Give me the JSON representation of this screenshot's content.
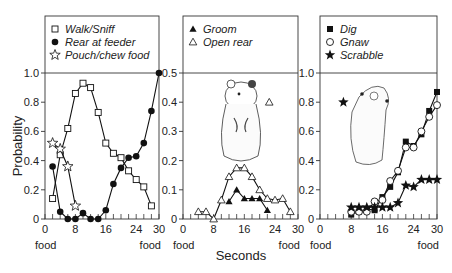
{
  "chart_data": {
    "type": "line",
    "xlabel": "Seconds",
    "ylabel": "Probability",
    "x_end_labels": [
      "food",
      "food"
    ],
    "panels": [
      {
        "id": "panel-locomotion",
        "xlim": [
          0,
          30
        ],
        "ylim": [
          0,
          1.0
        ],
        "x_ticks": [
          0,
          8,
          16,
          24,
          30
        ],
        "x_minor_step": 2,
        "y_ticks": [
          0,
          0.2,
          0.4,
          0.6,
          0.8,
          1.0
        ],
        "y_tick_labels": [
          "0",
          "0.2",
          "0.4",
          "0.6",
          "0.8",
          "1.0"
        ],
        "legend_position": "top",
        "series": [
          {
            "name": "Walk/Sniff",
            "marker": "open-square",
            "x": [
              2,
              4,
              6,
              8,
              10,
              12,
              14,
              16,
              18,
              20,
              22,
              24,
              26,
              28
            ],
            "y": [
              0.14,
              0.44,
              0.62,
              0.86,
              0.93,
              0.9,
              0.73,
              0.52,
              0.45,
              0.42,
              0.33,
              0.27,
              0.22,
              0.09
            ]
          },
          {
            "name": "Rear at feeder",
            "marker": "filled-circle",
            "x": [
              2,
              4,
              6,
              8,
              10,
              12,
              14,
              16,
              18,
              20,
              22,
              24,
              26,
              28,
              30
            ],
            "y": [
              0.36,
              0.05,
              0,
              0,
              0.04,
              0,
              0,
              0.06,
              0.24,
              0.35,
              0.42,
              0.43,
              0.52,
              0.74,
              1.0
            ]
          },
          {
            "name": "Pouch/chew food",
            "marker": "open-star",
            "x": [
              2,
              4,
              6,
              8
            ],
            "y": [
              0.52,
              0.48,
              0.36,
              0.09
            ]
          }
        ]
      },
      {
        "id": "panel-grooming",
        "xlim": [
          0,
          30
        ],
        "ylim": [
          0,
          0.5
        ],
        "x_ticks": [
          0,
          8,
          16,
          24,
          30
        ],
        "x_minor_step": 2,
        "y_ticks": [
          0,
          0.1,
          0.2,
          0.3,
          0.4,
          0.5
        ],
        "y_tick_labels": [
          "0",
          "0.1",
          "0.2",
          "0.3",
          "0.4",
          "0.5"
        ],
        "legend_position": "top",
        "illustration": "hamster-standing",
        "series": [
          {
            "name": "Groom",
            "marker": "filled-triangle",
            "x": [
              12,
              14,
              16,
              18,
              20,
              22
            ],
            "y": [
              0.06,
              0.1,
              0.07,
              0.07,
              0.07,
              0.03
            ]
          },
          {
            "name": "Open rear",
            "marker": "open-triangle",
            "x": [
              4,
              6,
              8,
              10,
              12,
              14,
              16,
              18,
              20,
              22,
              24,
              26,
              28
            ],
            "y": [
              0.025,
              0.025,
              0,
              0.065,
              0.145,
              0.175,
              0.175,
              0.145,
              0.1,
              0.07,
              0.065,
              0.07,
              0.025
            ]
          }
        ],
        "annotations": [
          {
            "marker": "open-triangle",
            "x": 22.5,
            "y": 0.4
          }
        ]
      },
      {
        "id": "panel-digging",
        "xlim": [
          0,
          30
        ],
        "ylim": [
          0,
          1.0
        ],
        "x_ticks": [
          0,
          8,
          16,
          24,
          30
        ],
        "x_minor_step": 2,
        "y_ticks": [
          0,
          0.2,
          0.4,
          0.6,
          0.8,
          1.0
        ],
        "y_tick_labels": [
          "0",
          "0.2",
          "0.4",
          "0.6",
          "0.8",
          "1.0"
        ],
        "legend_position": "top",
        "illustration": "hamster-rearing",
        "series": [
          {
            "name": "Dig",
            "marker": "filled-square",
            "x": [
              8,
              10,
              12,
              14,
              16,
              18,
              20,
              22,
              24,
              26,
              28,
              30
            ],
            "y": [
              0.03,
              0.05,
              0.07,
              0.06,
              0.15,
              0.22,
              0.32,
              0.53,
              0.5,
              0.58,
              0.74,
              0.87
            ]
          },
          {
            "name": "Gnaw",
            "marker": "open-circle",
            "x": [
              8,
              10,
              12,
              14,
              16,
              18,
              20,
              22,
              24,
              26,
              28,
              30
            ],
            "y": [
              0.05,
              0.05,
              0.05,
              0.12,
              0.13,
              0.26,
              0.33,
              0.49,
              0.49,
              0.6,
              0.7,
              0.78
            ]
          },
          {
            "name": "Scrabble",
            "marker": "filled-star",
            "x": [
              8,
              10,
              12,
              14,
              16,
              18,
              20,
              22,
              24,
              26,
              28,
              30
            ],
            "y": [
              0.08,
              0.08,
              0.08,
              0.08,
              0.08,
              0.08,
              0.11,
              0.23,
              0.22,
              0.27,
              0.27,
              0.27
            ]
          }
        ],
        "annotations": [
          {
            "marker": "filled-star",
            "x": 6,
            "y": 0.8
          }
        ]
      }
    ]
  }
}
